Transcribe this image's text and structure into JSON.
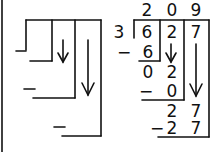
{
  "diagram": {
    "template_panel": {
      "minus_signs": [
        "−",
        "−",
        "−"
      ],
      "arrows": [
        "down-arrow",
        "down-arrow"
      ]
    },
    "worked_example": {
      "divisor": "3",
      "dividend_digits": [
        "6",
        "2",
        "7"
      ],
      "quotient_digits": [
        "2",
        "0",
        "9"
      ],
      "steps": [
        {
          "minus": "−",
          "subtract": "6"
        },
        {
          "bring_down": "0 2"
        },
        {
          "minus": "−",
          "subtract": "0"
        },
        {
          "bring_down": "2 7"
        },
        {
          "minus": "−",
          "subtract": "2 7"
        }
      ],
      "rows": {
        "r1_subtract": "6",
        "r2_d1": "0",
        "r2_d2": "2",
        "r3_subtract": "0",
        "r4_d1": "2",
        "r4_d2": "7",
        "r5_d1": "2",
        "r5_d2": "7",
        "minus": "−"
      }
    }
  }
}
